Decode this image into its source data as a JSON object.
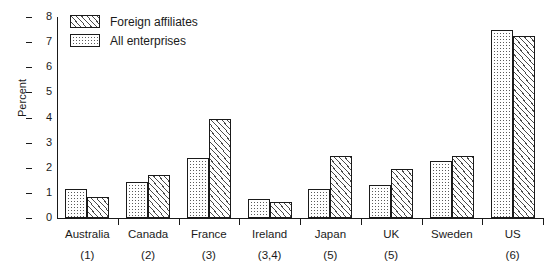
{
  "chart_data": {
    "type": "bar",
    "title": "",
    "xlabel": "",
    "ylabel": "Percent",
    "ylim": [
      0,
      8
    ],
    "yticks": [
      "0",
      "1",
      "2",
      "3",
      "4",
      "5",
      "6",
      "7",
      "8"
    ],
    "grid": false,
    "legend_position": "top-left",
    "categories": [
      "Australia",
      "Canada",
      "France",
      "Ireland",
      "Japan",
      "UK",
      "Sweden",
      "US"
    ],
    "category_notes": [
      "(1)",
      "(2)",
      "(3)",
      "(3,4)",
      "(5)",
      "(5)",
      "",
      "(6)"
    ],
    "series": [
      {
        "name": "All enterprises",
        "pattern": "dotted",
        "values": [
          1.15,
          1.45,
          2.4,
          0.75,
          1.15,
          1.3,
          2.25,
          7.5
        ]
      },
      {
        "name": "Foreign affiliates",
        "pattern": "hatched",
        "values": [
          0.85,
          1.7,
          3.95,
          0.65,
          2.45,
          1.95,
          2.45,
          7.25
        ]
      }
    ]
  },
  "legend": {
    "entries": [
      {
        "label": "Foreign affiliates",
        "pattern": "hatched"
      },
      {
        "label": "All enterprises",
        "pattern": "dotted"
      }
    ]
  },
  "axes": {
    "y_title": "Percent"
  },
  "colors": {
    "axis": "#1a1a1a",
    "pattern_ink": "#4a4a4a",
    "background": "#ffffff"
  }
}
